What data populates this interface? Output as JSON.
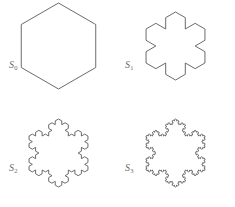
{
  "figure": {
    "background_color": "#ffffff",
    "stroke_color": "#5a5a5a",
    "fill_color": "#ffffff",
    "label_color": "#6b6b6b",
    "width": 235,
    "height": 207
  },
  "chart_data": {
    "type": "diagram",
    "xlabel": "",
    "ylabel": "",
    "panels": [
      {
        "label_base": "S",
        "label_subscript": "0",
        "label_text": "S0",
        "iteration": 0,
        "base_polygon": "hexagon",
        "base_sides": 6,
        "segment_count": 6,
        "orientation": "flat-top",
        "description": "Regular hexagon, the initiator of the construction",
        "center": [
          58.5,
          46
        ],
        "radius": 43,
        "start_angle_deg": 30
      },
      {
        "label_base": "S",
        "label_subscript": "1",
        "label_text": "S1",
        "iteration": 1,
        "base_polygon": "hexagon",
        "base_sides": 6,
        "segment_count": 24,
        "orientation": "flat-top",
        "description": "First iteration: each edge replaced by a four-segment Koch generator bumping outward",
        "center": [
          58.5,
          46
        ],
        "radius": 34,
        "start_angle_deg": 30
      },
      {
        "label_base": "S",
        "label_subscript": "2",
        "label_text": "S2",
        "iteration": 2,
        "base_polygon": "hexagon",
        "base_sides": 6,
        "segment_count": 96,
        "orientation": "flat-top",
        "description": "Second iteration of the Koch replacement rule",
        "center": [
          58.5,
          50
        ],
        "radius": 34,
        "start_angle_deg": 30
      },
      {
        "label_base": "S",
        "label_subscript": "3",
        "label_text": "S3",
        "iteration": 3,
        "base_polygon": "hexagon",
        "base_sides": 6,
        "segment_count": 384,
        "orientation": "flat-top",
        "description": "Third iteration of the Koch replacement rule",
        "center": [
          58.5,
          50
        ],
        "radius": 34,
        "start_angle_deg": 30
      }
    ],
    "generator": {
      "name": "koch-curve",
      "rule": "Replace each segment by four segments of one third length, with the middle two forming an outward equilateral bump",
      "scale_factor": 0.3333333333,
      "bump_angle_deg": 60,
      "segments_per_edge": 4
    },
    "legend": [],
    "grid": false
  }
}
